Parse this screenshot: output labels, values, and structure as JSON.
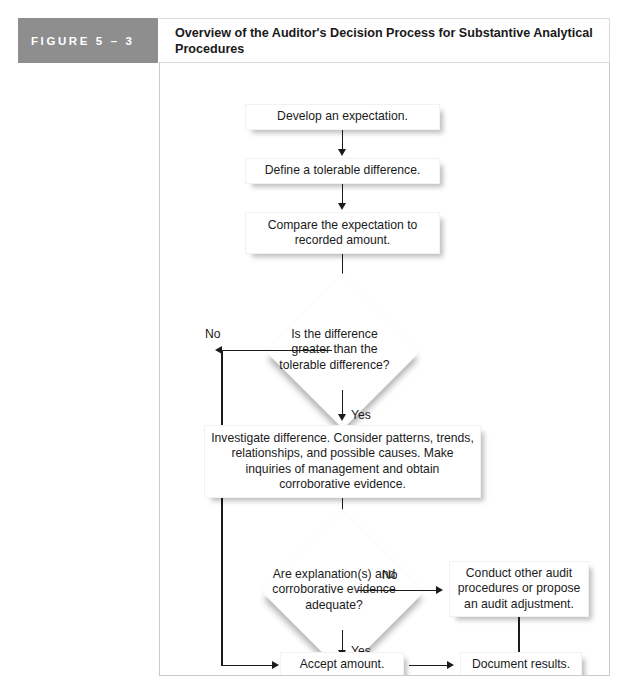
{
  "figure": {
    "label": "FIGURE  5 – 3",
    "title": "Overview of the Auditor's Decision Process for Substantive Analytical Procedures"
  },
  "colors": {
    "label_band": "#8e8e8e",
    "label_text": "#ffffff",
    "node_fill": "#ffffff",
    "line": "#1b1b1b",
    "frame_border": "#c9c9c9"
  },
  "flow": {
    "nodes": [
      {
        "id": "develop",
        "type": "process",
        "text": "Develop an expectation."
      },
      {
        "id": "tolerable",
        "type": "process",
        "text": "Define a tolerable difference."
      },
      {
        "id": "compare",
        "type": "process",
        "text": "Compare the expectation to recorded amount."
      },
      {
        "id": "diff_check",
        "type": "decision",
        "text": "Is the difference greater than the tolerable difference?"
      },
      {
        "id": "investigate",
        "type": "process",
        "text": "Investigate difference. Consider patterns, trends, relationships, and possible causes. Make inquiries of management and obtain corroborative evidence."
      },
      {
        "id": "adequacy",
        "type": "decision",
        "text": "Are explanation(s) and corroborative evidence adequate?"
      },
      {
        "id": "conduct",
        "type": "process",
        "text": "Conduct other audit procedures or propose an audit adjustment."
      },
      {
        "id": "accept",
        "type": "process",
        "text": "Accept amount."
      },
      {
        "id": "document",
        "type": "process",
        "text": "Document results."
      }
    ],
    "edge_labels": {
      "diff_no": "No",
      "diff_yes": "Yes",
      "adequacy_no": "No",
      "adequacy_yes": "Yes"
    }
  }
}
